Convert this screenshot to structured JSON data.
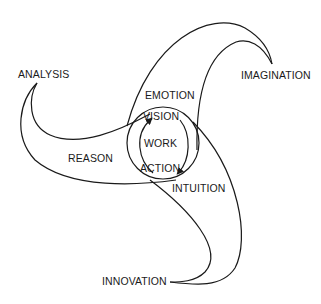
{
  "diagram": {
    "center": {
      "label": "WORK"
    },
    "cycle": {
      "top": "VISION",
      "bottom": "ACTION"
    },
    "regions": {
      "upper": "EMOTION",
      "left": "REASON",
      "lower_right": "INTUITION"
    },
    "blade_tips": {
      "top_right": "IMAGINATION",
      "left": "ANALYSIS",
      "bottom": "INNOVATION"
    },
    "colors": {
      "stroke": "#1a1a1a",
      "background": "#ffffff"
    }
  }
}
